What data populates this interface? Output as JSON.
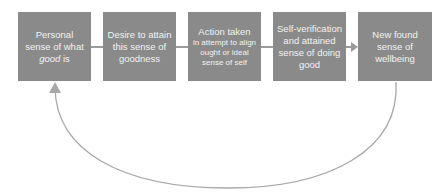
{
  "diagram": {
    "type": "cycle-flow",
    "colors": {
      "box_fill": "#8a8a8a",
      "box_text": "#f2f2f2",
      "arrow": "#9a9a9a",
      "background": "#ffffff"
    },
    "boxes": [
      {
        "id": "personal-sense",
        "text_before": "Personal sense of what ",
        "text_italic": "good",
        "text_after": " is"
      },
      {
        "id": "desire",
        "text": "Desire to attain this sense of goodness"
      },
      {
        "id": "action",
        "title": "Action taken",
        "subtitle": "in attempt to align ought or ideal sense of self"
      },
      {
        "id": "self-verification",
        "text": "Self-verification and attained sense of doing good"
      },
      {
        "id": "wellbeing",
        "text": "New found sense of wellbeing"
      }
    ],
    "feedback_arrow": {
      "from": "wellbeing",
      "to": "personal-sense"
    }
  }
}
